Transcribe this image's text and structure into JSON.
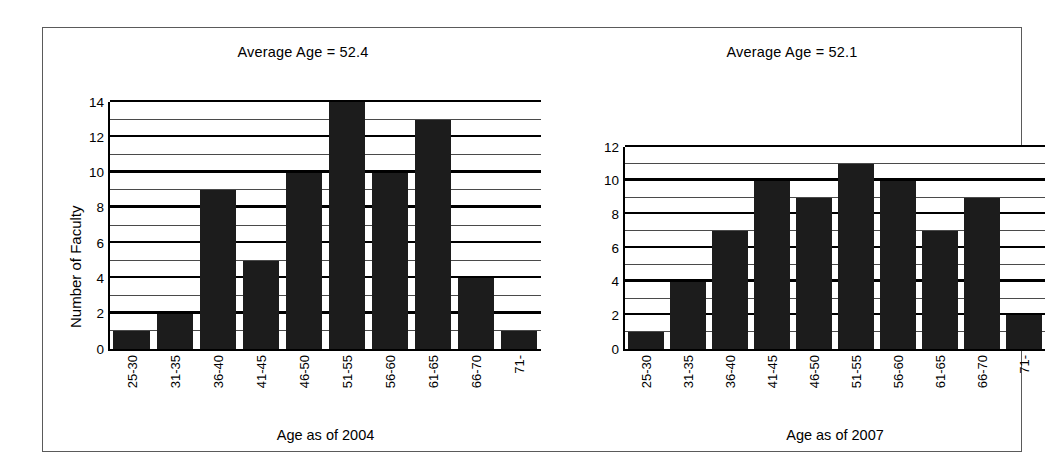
{
  "figure": {
    "background_color": "#ffffff",
    "frame_color": "#5a5a5a",
    "bar_color": "#1c1c1c"
  },
  "chart_data": [
    {
      "type": "bar",
      "panel": "left",
      "title": "Average Age = 52.4",
      "xlabel": "Age as of 2004",
      "ylabel": "Number of Faculty",
      "categories": [
        "25-30",
        "31-35",
        "36-40",
        "41-45",
        "46-50",
        "51-55",
        "56-60",
        "61-65",
        "66-70",
        "71-"
      ],
      "values": [
        1,
        2,
        9,
        5,
        10,
        14,
        10,
        13,
        4,
        1
      ],
      "ylim": [
        0,
        14
      ],
      "ytick_labels": [
        "0",
        "2",
        "4",
        "6",
        "8",
        "10",
        "12",
        "14"
      ],
      "ytick_values": [
        0,
        2,
        4,
        6,
        8,
        10,
        12,
        14
      ],
      "minor_gridline_values": [
        1,
        3,
        5,
        7,
        9,
        11,
        13
      ],
      "grid": true,
      "legend": "none"
    },
    {
      "type": "bar",
      "panel": "right",
      "title": "Average Age = 52.1",
      "xlabel": "Age as of 2007",
      "ylabel": "",
      "categories": [
        "25-30",
        "31-35",
        "36-40",
        "41-45",
        "46-50",
        "51-55",
        "56-60",
        "61-65",
        "66-70",
        "71-"
      ],
      "values": [
        1,
        4,
        7,
        10,
        9,
        11,
        10,
        7,
        9,
        2
      ],
      "ylim": [
        0,
        12
      ],
      "ytick_labels": [
        "0",
        "2",
        "4",
        "6",
        "8",
        "10",
        "12"
      ],
      "ytick_values": [
        0,
        2,
        4,
        6,
        8,
        10,
        12
      ],
      "minor_gridline_values": [
        1,
        3,
        5,
        7,
        9,
        11
      ],
      "grid": true,
      "legend": "none"
    }
  ]
}
